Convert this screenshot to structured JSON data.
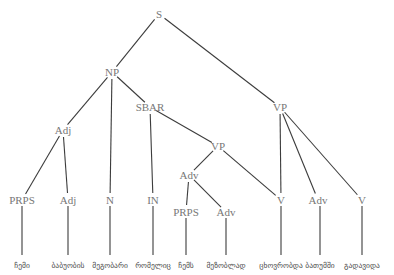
{
  "figure": {
    "kind": "constituency-parse-tree",
    "width": 394,
    "height": 275,
    "background_color": "#ffffff",
    "node_text_color": "#777777",
    "leaf_text_color": "#4a4a4a",
    "edge_color": "#3c3c3c"
  },
  "nodes": [
    {
      "id": "S",
      "label": "S",
      "x": 159,
      "y": 14
    },
    {
      "id": "NP",
      "label": "NP",
      "x": 112,
      "y": 72
    },
    {
      "id": "VPR",
      "label": "VP",
      "x": 280,
      "y": 107
    },
    {
      "id": "ADJ1",
      "label": "Adj",
      "x": 63,
      "y": 130
    },
    {
      "id": "SBAR",
      "label": "SBAR",
      "x": 150,
      "y": 107
    },
    {
      "id": "PRPS1",
      "label": "PRPS",
      "x": 22,
      "y": 200
    },
    {
      "id": "ADJ2",
      "label": "Adj",
      "x": 68,
      "y": 200
    },
    {
      "id": "N1",
      "label": "N",
      "x": 110,
      "y": 200
    },
    {
      "id": "IN1",
      "label": "IN",
      "x": 153,
      "y": 200
    },
    {
      "id": "VPI",
      "label": "VP",
      "x": 218,
      "y": 146
    },
    {
      "id": "ADV1",
      "label": "Adv",
      "x": 189,
      "y": 175
    },
    {
      "id": "PRPS2",
      "label": "PRPS",
      "x": 186,
      "y": 212
    },
    {
      "id": "ADV2",
      "label": "Adv",
      "x": 226,
      "y": 212
    },
    {
      "id": "V1",
      "label": "V",
      "x": 281,
      "y": 200
    },
    {
      "id": "ADV3",
      "label": "Adv",
      "x": 318,
      "y": 200
    },
    {
      "id": "V2",
      "label": "V",
      "x": 362,
      "y": 200
    }
  ],
  "edges": [
    {
      "from": "S",
      "to": "NP"
    },
    {
      "from": "S",
      "to": "VPR"
    },
    {
      "from": "NP",
      "to": "ADJ1"
    },
    {
      "from": "NP",
      "to": "N1"
    },
    {
      "from": "NP",
      "to": "SBAR"
    },
    {
      "from": "ADJ1",
      "to": "PRPS1"
    },
    {
      "from": "ADJ1",
      "to": "ADJ2"
    },
    {
      "from": "SBAR",
      "to": "IN1"
    },
    {
      "from": "SBAR",
      "to": "VPI"
    },
    {
      "from": "VPI",
      "to": "ADV1"
    },
    {
      "from": "VPI",
      "to": "V1"
    },
    {
      "from": "ADV1",
      "to": "PRPS2"
    },
    {
      "from": "ADV1",
      "to": "ADV2"
    },
    {
      "from": "VPR",
      "to": "V1"
    },
    {
      "from": "VPR",
      "to": "ADV3"
    },
    {
      "from": "VPR",
      "to": "V2"
    }
  ],
  "leaves": [
    {
      "parent": "PRPS1",
      "word": "ჩემი",
      "x": 22,
      "y": 266
    },
    {
      "parent": "ADJ2",
      "word": "ბაბუობის",
      "x": 68,
      "y": 266
    },
    {
      "parent": "N1",
      "word": "მეგობარი",
      "x": 110,
      "y": 266
    },
    {
      "parent": "IN1",
      "word": "რომელიც",
      "x": 153,
      "y": 266
    },
    {
      "parent": "PRPS2",
      "word": "ჩემს",
      "x": 186,
      "y": 266
    },
    {
      "parent": "ADV2",
      "word": "მეზობლად",
      "x": 226,
      "y": 266
    },
    {
      "parent": "V1",
      "word": "ცხოვრობდა",
      "x": 281,
      "y": 266
    },
    {
      "parent": "ADV3",
      "word": "ბათუმში",
      "x": 320,
      "y": 266
    },
    {
      "parent": "V2",
      "word": "გადავიდა",
      "x": 362,
      "y": 266
    }
  ],
  "leaf_stems": [
    {
      "parent": "PRPS1",
      "x": 22,
      "y_top": 206,
      "y_bottom": 255
    },
    {
      "parent": "ADJ2",
      "x": 68,
      "y_top": 206,
      "y_bottom": 255
    },
    {
      "parent": "N1",
      "x": 110,
      "y_top": 206,
      "y_bottom": 255
    },
    {
      "parent": "IN1",
      "x": 153,
      "y_top": 206,
      "y_bottom": 255
    },
    {
      "parent": "PRPS2",
      "x": 186,
      "y_top": 218,
      "y_bottom": 255
    },
    {
      "parent": "ADV2",
      "x": 226,
      "y_top": 218,
      "y_bottom": 255
    },
    {
      "parent": "V1",
      "x": 281,
      "y_top": 206,
      "y_bottom": 255
    },
    {
      "parent": "ADV3",
      "x": 320,
      "y_top": 206,
      "y_bottom": 255
    },
    {
      "parent": "V2",
      "x": 362,
      "y_top": 206,
      "y_bottom": 255
    }
  ]
}
